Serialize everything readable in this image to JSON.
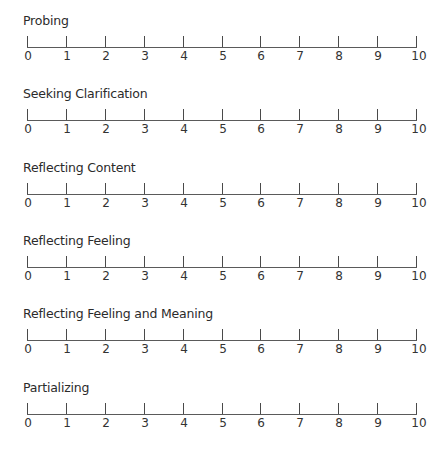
{
  "scales": [
    {
      "title": "Probing"
    },
    {
      "title": "Seeking Clarification"
    },
    {
      "title": "Reflecting Content"
    },
    {
      "title": "Reflecting Feeling"
    },
    {
      "title": "Reflecting Feeling and Meaning"
    },
    {
      "title": "Partializing"
    }
  ],
  "tick_labels": [
    "0",
    "1",
    "2",
    "3",
    "4",
    "5",
    "6",
    "7",
    "8",
    "9",
    "10"
  ],
  "scale_range": {
    "min": 0,
    "max": 10,
    "step": 1
  },
  "colors": {
    "line": "#5a5a5a",
    "text": "#2b2b2b",
    "background": "#ffffff"
  }
}
